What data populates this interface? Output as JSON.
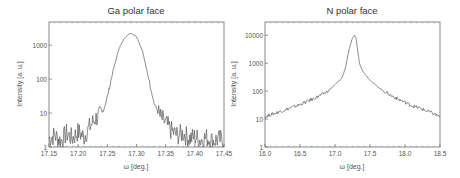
{
  "chart_data": [
    {
      "type": "line",
      "title": "Ga polar face",
      "xlabel": "ω [deg.]",
      "ylabel": "Intensity [a. u.]",
      "yscale": "log",
      "xlim": [
        17.15,
        17.45
      ],
      "ylim": [
        1,
        4800
      ],
      "xticks": [
        "17.15",
        "17.20",
        "17.25",
        "17.30",
        "17.35",
        "17.40",
        "17.45"
      ],
      "yticks": [
        "1",
        "10",
        "100",
        "1000"
      ],
      "grid": false,
      "legend": null,
      "series": [
        {
          "name": "Ga polar face",
          "x": [
            17.15,
            17.16,
            17.17,
            17.18,
            17.19,
            17.2,
            17.21,
            17.22,
            17.23,
            17.24,
            17.245,
            17.25,
            17.26,
            17.27,
            17.28,
            17.29,
            17.3,
            17.31,
            17.32,
            17.33,
            17.34,
            17.35,
            17.36,
            17.37,
            17.38,
            17.39,
            17.4,
            17.41,
            17.42,
            17.43,
            17.44,
            17.45
          ],
          "values": [
            1.8,
            2.2,
            1.5,
            2.5,
            1.8,
            2.8,
            2.0,
            4.0,
            7.0,
            9.0,
            15,
            30,
            180,
            800,
            1700,
            2300,
            1800,
            700,
            120,
            20,
            8,
            5,
            3.0,
            2.2,
            2.5,
            1.8,
            2.0,
            1.6,
            1.9,
            1.5,
            1.7,
            1.6
          ]
        }
      ]
    },
    {
      "type": "line",
      "title": "N polar face",
      "xlabel": "ω [deg.]",
      "ylabel": "Intensity [a. u.]",
      "yscale": "log",
      "xlim": [
        16.0,
        18.5
      ],
      "ylim": [
        1,
        30000
      ],
      "xticks": [
        "16.0",
        "16.5",
        "17.0",
        "17.5",
        "18.0",
        "18.5"
      ],
      "yticks": [
        "1",
        "10",
        "100",
        "1000",
        "10000"
      ],
      "grid": false,
      "legend": null,
      "series": [
        {
          "name": "N polar face",
          "x": [
            16.0,
            16.1,
            16.2,
            16.3,
            16.4,
            16.5,
            16.6,
            16.7,
            16.8,
            16.9,
            17.0,
            17.1,
            17.15,
            17.2,
            17.25,
            17.28,
            17.3,
            17.35,
            17.4,
            17.5,
            17.6,
            17.7,
            17.8,
            17.9,
            18.0,
            18.1,
            18.2,
            18.3,
            18.4,
            18.5
          ],
          "values": [
            12,
            15,
            18,
            22,
            27,
            33,
            42,
            55,
            72,
            100,
            170,
            300,
            700,
            3000,
            8000,
            10000,
            8000,
            1000,
            500,
            250,
            150,
            100,
            70,
            52,
            40,
            30,
            25,
            20,
            16,
            12
          ]
        }
      ]
    }
  ]
}
